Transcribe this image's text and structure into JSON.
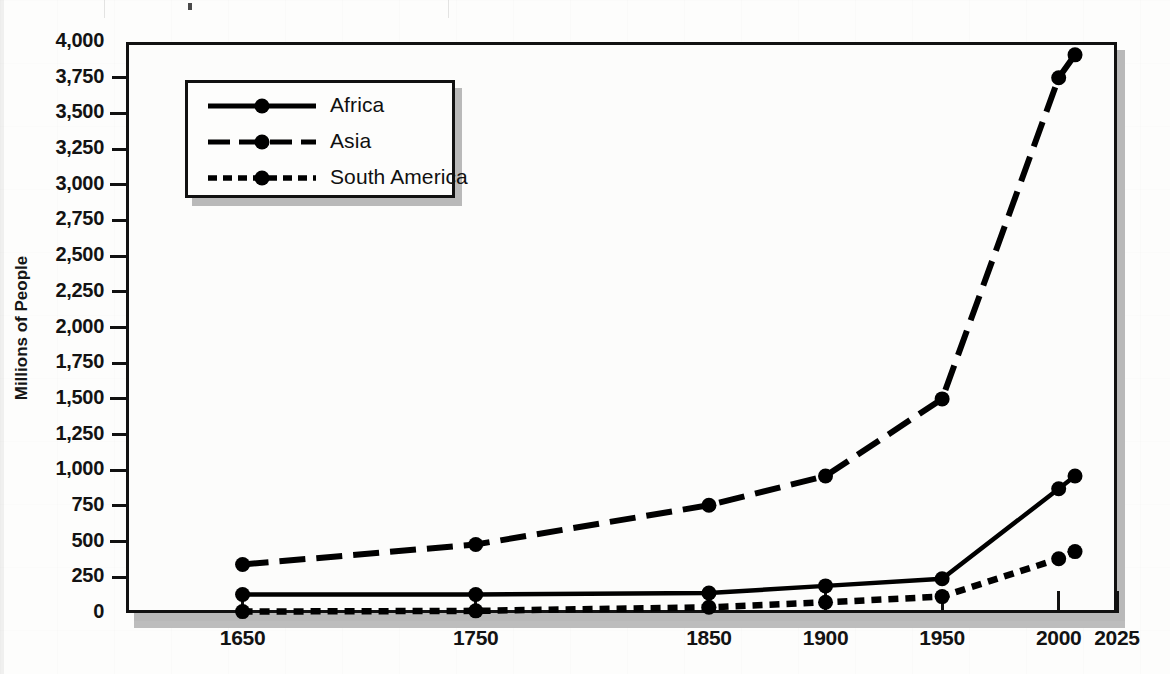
{
  "chart_data": {
    "type": "line",
    "title": "",
    "xlabel": "",
    "ylabel": "Millions of People",
    "x": [
      1650,
      1750,
      1850,
      1900,
      1950,
      2000,
      2007
    ],
    "xticks": [
      1650,
      1750,
      1850,
      1900,
      1950,
      2000,
      2025
    ],
    "xlim": [
      1600,
      2025
    ],
    "ylim": [
      0,
      4000
    ],
    "yticks": [
      0,
      250,
      500,
      750,
      1000,
      1250,
      1500,
      1750,
      2000,
      2250,
      2500,
      2750,
      3000,
      3250,
      3500,
      3750,
      4000
    ],
    "ytick_labels": [
      "0",
      "250",
      "500",
      "750",
      "1,000",
      "1,250",
      "1,500",
      "1,750",
      "2,000",
      "2,250",
      "2,500",
      "2,750",
      "3,000",
      "3,250",
      "3,500",
      "3,750",
      "4,000"
    ],
    "grid": false,
    "legend_position": "upper left",
    "series": [
      {
        "name": "Africa",
        "style": "solid",
        "color": "#000000",
        "values": [
          130,
          130,
          140,
          190,
          240,
          870,
          960
        ]
      },
      {
        "name": "Asia",
        "style": "dashed",
        "color": "#000000",
        "values": [
          340,
          480,
          755,
          960,
          1500,
          3750,
          3910
        ]
      },
      {
        "name": "South America",
        "style": "dotted",
        "color": "#000000",
        "values": [
          10,
          15,
          40,
          75,
          115,
          380,
          430
        ]
      }
    ]
  },
  "legend": {
    "entries": [
      {
        "label": "Africa",
        "key": "solid-line-key"
      },
      {
        "label": "Asia",
        "key": "dashed-line-key"
      },
      {
        "label": "South America",
        "key": "dotted-line-key"
      }
    ]
  },
  "axes": {
    "y_title": "Millions of People"
  }
}
